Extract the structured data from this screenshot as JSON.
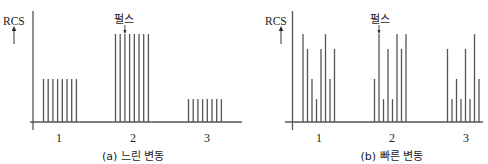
{
  "chart_data": [
    {
      "type": "bar",
      "panel": "a",
      "title": "(a) 느린 변동",
      "ylabel": "RCS",
      "annotation": "펄스",
      "annotation_target": {
        "group": 1,
        "bar": 2
      },
      "categories": [
        "1",
        "2",
        "3"
      ],
      "bars_per_group": 8,
      "values": [
        [
          0.49,
          0.49,
          0.49,
          0.49,
          0.49,
          0.49,
          0.49,
          0.49
        ],
        [
          1.0,
          1.0,
          1.0,
          1.0,
          1.0,
          1.0,
          1.0,
          1.0
        ],
        [
          0.26,
          0.26,
          0.26,
          0.26,
          0.26,
          0.26,
          0.26,
          0.26
        ]
      ],
      "ylim": [
        0,
        1.1
      ],
      "grid": false,
      "legend": null,
      "layout": {
        "yaxis_x": 33,
        "yaxis_top": 11,
        "yaxis_bottom": 130,
        "baseline_y": 122,
        "xaxis_left": 30,
        "xaxis_right": 242,
        "full_height_px": 88,
        "group_starts": [
          43.5,
          115.5,
          188.5
        ],
        "bar_spacing": 4.7,
        "tick_x": [
          59,
          133,
          207
        ],
        "tick_y": 138,
        "caption_x": 133,
        "caption_y": 155,
        "ylabel_x": 14,
        "ylabel_y": 21,
        "arrow_x": 14,
        "arrow_top": 26,
        "arrow_bottom": 44,
        "annotation_x": 124,
        "annotation_y": 18
      }
    },
    {
      "type": "bar",
      "panel": "b",
      "title": "(b) 빠른 변동",
      "ylabel": "RCS",
      "annotation": "펄스",
      "annotation_target": {
        "group": 1,
        "bar": 1
      },
      "categories": [
        "1",
        "2",
        "3"
      ],
      "bars_per_group": 8,
      "values": [
        [
          1.0,
          0.83,
          0.49,
          0.26,
          0.83,
          1.0,
          0.49,
          0.83
        ],
        [
          0.49,
          1.0,
          0.26,
          0.83,
          0.26,
          1.0,
          0.83,
          1.0
        ],
        [
          0.83,
          0.26,
          0.49,
          0.26,
          0.83,
          0.26,
          1.0,
          0.49
        ]
      ],
      "ylim": [
        0,
        1.1
      ],
      "grid": false,
      "legend": null,
      "layout": {
        "yaxis_x": 292.5,
        "yaxis_top": 11,
        "yaxis_bottom": 130,
        "baseline_y": 122,
        "xaxis_left": 285,
        "xaxis_right": 483,
        "full_height_px": 88,
        "group_starts": [
          303,
          374.5,
          447.5
        ],
        "bar_spacing": 4.5,
        "tick_x": [
          319,
          392,
          466
        ],
        "tick_y": 138,
        "caption_x": 392,
        "caption_y": 155,
        "ylabel_x": 276,
        "ylabel_y": 21,
        "arrow_x": 281,
        "arrow_top": 26,
        "arrow_bottom": 44,
        "annotation_x": 380,
        "annotation_y": 18
      }
    }
  ]
}
